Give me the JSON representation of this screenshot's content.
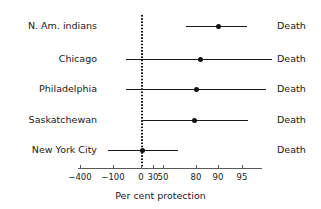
{
  "chart_data": {
    "type": "scatter",
    "title": "",
    "xlabel": "Per cent protection",
    "ylabel": "",
    "grid": false,
    "legend": null,
    "null_value": 0,
    "axis": {
      "tick_values": [
        -400,
        -100,
        0,
        30,
        50,
        80,
        90,
        95
      ],
      "tick_labels": [
        "−400",
        "−100",
        "0",
        "30",
        "50",
        "80",
        "90",
        "95"
      ],
      "tick_px": [
        80,
        113,
        141,
        153,
        163,
        196,
        218,
        242
      ],
      "axis_px_start": 78,
      "axis_px_end": 262,
      "scale": "non-linear (efficacy / logit-like)"
    },
    "rows": [
      {
        "label": "N. Am. indians",
        "outcome": "Death",
        "estimate": 90,
        "ci_low": 75,
        "ci_high": 96,
        "px": {
          "center": 26,
          "dot_x": 218,
          "line_start": 186,
          "line_end": 247
        }
      },
      {
        "label": "Chicago",
        "outcome": "Death",
        "estimate": 83,
        "ci_low": -150,
        "ci_high": 99,
        "px": {
          "center": 59,
          "dot_x": 200,
          "line_start": 126,
          "line_end": 272
        }
      },
      {
        "label": "Philadelphia",
        "outcome": "Death",
        "estimate": 80,
        "ci_low": -150,
        "ci_high": 98,
        "px": {
          "center": 89,
          "dot_x": 196,
          "line_start": 126,
          "line_end": 266
        }
      },
      {
        "label": "Saskatchewan",
        "outcome": "Death",
        "estimate": 80,
        "ci_low": 0,
        "ci_high": 96,
        "px": {
          "center": 120,
          "dot_x": 194,
          "line_start": 143,
          "line_end": 248
        }
      },
      {
        "label": "New York City",
        "outcome": "Death",
        "estimate": 0,
        "ci_low": -110,
        "ci_high": 55,
        "px": {
          "center": 150,
          "dot_x": 142,
          "line_start": 108,
          "line_end": 178
        }
      }
    ]
  },
  "colors": {
    "marker": "#111111",
    "line": "#1a1a1a",
    "axis": "#5a5a5a",
    "text": "#1a1a1a",
    "background": "#ffffff"
  }
}
